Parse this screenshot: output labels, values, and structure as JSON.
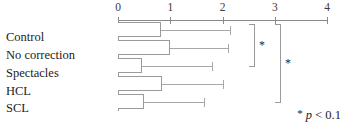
{
  "chart_data": {
    "type": "bar",
    "orientation": "horizontal",
    "title": "",
    "xlabel": "",
    "ylabel": "",
    "xlim": [
      0,
      4
    ],
    "grid": false,
    "legend": null,
    "xticks": [
      {
        "label": "0",
        "value": 0
      },
      {
        "label": "1",
        "value": 1
      },
      {
        "label": "2",
        "value": 2
      },
      {
        "label": "3",
        "value": 3
      },
      {
        "label": "4",
        "value": 4
      }
    ],
    "categories": [
      "Control",
      "No correction",
      "Spectacles",
      "HCL",
      "SCL"
    ],
    "values": [
      0.82,
      1.0,
      0.45,
      0.85,
      0.5
    ],
    "errors_upper": [
      2.15,
      2.1,
      1.8,
      2.0,
      1.65
    ],
    "annotations": {
      "footnote_star": "*",
      "footnote_p": "p",
      "footnote_rest": " < 0.1",
      "significance_brackets": [
        {
          "label": "*",
          "from_category": "Control",
          "to_category": "Spectacles"
        },
        {
          "label": "*",
          "from_category": "Control",
          "to_category": "SCL"
        }
      ]
    }
  },
  "axis": {
    "tick_labels": [
      "0",
      "1",
      "2",
      "3",
      "4"
    ]
  },
  "labels": {
    "control": "Control",
    "no_correction": "No correction",
    "spectacles": "Spectacles",
    "hcl": "HCL",
    "scl": "SCL"
  },
  "footnote": {
    "star": "*",
    "p": "p",
    "rest": " < 0.1"
  },
  "stars": {
    "first": "*",
    "second": "*"
  },
  "colors": {
    "axis": "#8a8a8a",
    "bar_border": "#9a9a9a",
    "whisker": "#a8a8a8",
    "text": "#1c1c1c",
    "background": "#ffffff"
  }
}
